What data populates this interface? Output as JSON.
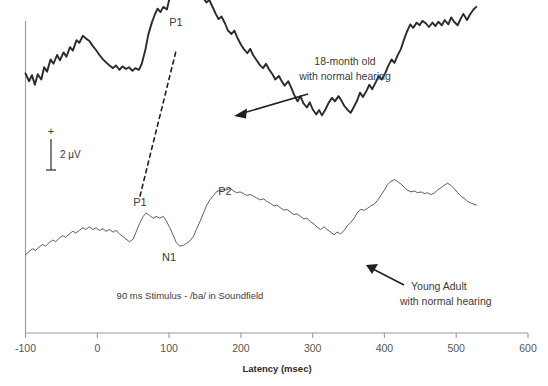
{
  "chart_data": {
    "type": "line",
    "title": "",
    "xlabel": "Latency (msec)",
    "ylabel": "",
    "xlim": [
      -100,
      600
    ],
    "ylim_note": "arbitrary microvolt scale, positive up",
    "xticks": [
      -100,
      0,
      100,
      200,
      300,
      400,
      500,
      600
    ],
    "xticklabels": [
      "-100",
      "0",
      "100",
      "200",
      "300",
      "400",
      "500",
      "600"
    ],
    "grid": false,
    "legend_position": "inline-annotations",
    "scale_bar": {
      "label": "2 µV",
      "positive_sign": "+",
      "negative_sign": "–",
      "microvolts": 2
    },
    "stimulus_note": "90 ms Stimulus - /ba/ in Soundfield",
    "series": [
      {
        "name": "18-month old with normal hearing",
        "style": "thick",
        "annotation": {
          "line1": "18-month old",
          "line2": "with normal hearing"
        },
        "peaks": [
          {
            "label": "P1",
            "latency_msec": 118,
            "note": "large positive peak"
          }
        ],
        "points": [
          [
            -100,
            2.55
          ],
          [
            -95,
            2.1
          ],
          [
            -91,
            2.45
          ],
          [
            -87,
            1.9
          ],
          [
            -83,
            2.5
          ],
          [
            -78,
            2.2
          ],
          [
            -74,
            2.9
          ],
          [
            -70,
            2.65
          ],
          [
            -65,
            3.35
          ],
          [
            -61,
            3.1
          ],
          [
            -56,
            3.6
          ],
          [
            -52,
            3.3
          ],
          [
            -47,
            3.75
          ],
          [
            -43,
            3.5
          ],
          [
            -38,
            4.05
          ],
          [
            -34,
            3.85
          ],
          [
            -29,
            4.45
          ],
          [
            -25,
            4.3
          ],
          [
            -20,
            4.7
          ],
          [
            -16,
            4.55
          ],
          [
            -11,
            4.4
          ],
          [
            -7,
            4.15
          ],
          [
            -2,
            3.9
          ],
          [
            3,
            3.6
          ],
          [
            8,
            3.35
          ],
          [
            13,
            3.15
          ],
          [
            17,
            3.0
          ],
          [
            22,
            2.85
          ],
          [
            26,
            3.0
          ],
          [
            31,
            2.75
          ],
          [
            35,
            2.95
          ],
          [
            40,
            2.8
          ],
          [
            44,
            2.9
          ],
          [
            49,
            2.7
          ],
          [
            53,
            2.85
          ],
          [
            58,
            2.75
          ],
          [
            62,
            3.1
          ],
          [
            67,
            3.9
          ],
          [
            71,
            4.75
          ],
          [
            76,
            5.45
          ],
          [
            80,
            5.9
          ],
          [
            84,
            6.25
          ],
          [
            88,
            6.05
          ],
          [
            92,
            6.35
          ],
          [
            97,
            6.2
          ],
          [
            101,
            6.9
          ],
          [
            105,
            7.55
          ],
          [
            110,
            8.15
          ],
          [
            114,
            8.6
          ],
          [
            118,
            8.85
          ],
          [
            122,
            8.45
          ],
          [
            126,
            8.6
          ],
          [
            130,
            8.15
          ],
          [
            134,
            7.7
          ],
          [
            139,
            7.95
          ],
          [
            143,
            7.45
          ],
          [
            147,
            6.9
          ],
          [
            152,
            6.6
          ],
          [
            156,
            6.75
          ],
          [
            160,
            6.4
          ],
          [
            165,
            5.95
          ],
          [
            169,
            5.65
          ],
          [
            173,
            5.8
          ],
          [
            178,
            5.4
          ],
          [
            182,
            5.0
          ],
          [
            187,
            4.8
          ],
          [
            191,
            5.0
          ],
          [
            195,
            4.6
          ],
          [
            200,
            4.2
          ],
          [
            204,
            3.95
          ],
          [
            209,
            3.7
          ],
          [
            213,
            3.95
          ],
          [
            217,
            3.6
          ],
          [
            222,
            3.3
          ],
          [
            226,
            3.05
          ],
          [
            231,
            2.85
          ],
          [
            235,
            3.1
          ],
          [
            239,
            2.8
          ],
          [
            244,
            2.5
          ],
          [
            248,
            2.2
          ],
          [
            253,
            2.4
          ],
          [
            257,
            2.1
          ],
          [
            261,
            1.85
          ],
          [
            266,
            2.1
          ],
          [
            270,
            1.75
          ],
          [
            274,
            1.35
          ],
          [
            279,
            0.95
          ],
          [
            283,
            1.25
          ],
          [
            287,
            0.85
          ],
          [
            292,
            0.6
          ],
          [
            296,
            0.9
          ],
          [
            300,
            0.5
          ],
          [
            305,
            0.2
          ],
          [
            309,
            0.45
          ],
          [
            313,
            0.15
          ],
          [
            318,
            0.5
          ],
          [
            322,
            0.85
          ],
          [
            327,
            1.15
          ],
          [
            331,
            0.95
          ],
          [
            336,
            1.25
          ],
          [
            340,
            1.0
          ],
          [
            344,
            0.7
          ],
          [
            349,
            0.45
          ],
          [
            353,
            0.3
          ],
          [
            357,
            0.6
          ],
          [
            362,
            1.0
          ],
          [
            366,
            1.45
          ],
          [
            370,
            1.2
          ],
          [
            375,
            1.55
          ],
          [
            379,
            1.9
          ],
          [
            383,
            1.65
          ],
          [
            388,
            2.05
          ],
          [
            392,
            2.4
          ],
          [
            396,
            2.2
          ],
          [
            401,
            2.55
          ],
          [
            405,
            2.95
          ],
          [
            410,
            3.35
          ],
          [
            414,
            3.15
          ],
          [
            418,
            3.55
          ],
          [
            423,
            3.95
          ],
          [
            427,
            4.45
          ],
          [
            431,
            4.9
          ],
          [
            436,
            5.35
          ],
          [
            440,
            5.15
          ],
          [
            445,
            5.45
          ],
          [
            449,
            5.3
          ],
          [
            453,
            5.55
          ],
          [
            458,
            5.4
          ],
          [
            462,
            5.2
          ],
          [
            467,
            5.45
          ],
          [
            471,
            5.25
          ],
          [
            475,
            5.5
          ],
          [
            480,
            5.3
          ],
          [
            484,
            5.6
          ],
          [
            489,
            5.35
          ],
          [
            493,
            5.75
          ],
          [
            497,
            5.5
          ],
          [
            502,
            5.3
          ],
          [
            506,
            5.65
          ],
          [
            510,
            5.95
          ],
          [
            515,
            5.6
          ],
          [
            519,
            5.9
          ],
          [
            524,
            6.2
          ],
          [
            528,
            6.35
          ]
        ]
      },
      {
        "name": "Young Adult with normal hearing",
        "style": "thin",
        "annotation": {
          "line1": "Young Adult",
          "line2": "with normal hearing"
        },
        "peaks": [
          {
            "label": "P1",
            "latency_msec": 60,
            "note": "small positive peak"
          },
          {
            "label": "N1",
            "latency_msec": 110,
            "note": "negative trough"
          },
          {
            "label": "P2",
            "latency_msec": 185,
            "note": "positive peak"
          }
        ],
        "points": [
          [
            -100,
            -1.25
          ],
          [
            -95,
            -1.05
          ],
          [
            -90,
            -0.9
          ],
          [
            -86,
            -1.0
          ],
          [
            -81,
            -0.8
          ],
          [
            -76,
            -0.65
          ],
          [
            -72,
            -0.75
          ],
          [
            -67,
            -0.55
          ],
          [
            -62,
            -0.4
          ],
          [
            -58,
            -0.5
          ],
          [
            -53,
            -0.3
          ],
          [
            -48,
            -0.15
          ],
          [
            -44,
            -0.25
          ],
          [
            -39,
            -0.05
          ],
          [
            -34,
            0.1
          ],
          [
            -30,
            0.0
          ],
          [
            -25,
            0.15
          ],
          [
            -20,
            0.3
          ],
          [
            -16,
            0.2
          ],
          [
            -11,
            0.35
          ],
          [
            -6,
            0.2
          ],
          [
            -2,
            0.3
          ],
          [
            3,
            0.15
          ],
          [
            8,
            0.25
          ],
          [
            12,
            0.1
          ],
          [
            17,
            0.2
          ],
          [
            22,
            0.05
          ],
          [
            26,
            0.15
          ],
          [
            31,
            -0.05
          ],
          [
            36,
            -0.2
          ],
          [
            40,
            -0.35
          ],
          [
            45,
            -0.5
          ],
          [
            50,
            -0.35
          ],
          [
            54,
            0.05
          ],
          [
            59,
            0.55
          ],
          [
            64,
            0.95
          ],
          [
            68,
            1.15
          ],
          [
            73,
            1.0
          ],
          [
            78,
            0.85
          ],
          [
            82,
            0.95
          ],
          [
            87,
            0.85
          ],
          [
            92,
            0.95
          ],
          [
            96,
            0.7
          ],
          [
            101,
            0.3
          ],
          [
            106,
            -0.15
          ],
          [
            110,
            -0.55
          ],
          [
            115,
            -0.75
          ],
          [
            120,
            -0.7
          ],
          [
            124,
            -0.6
          ],
          [
            129,
            -0.45
          ],
          [
            134,
            -0.2
          ],
          [
            138,
            0.2
          ],
          [
            143,
            0.65
          ],
          [
            148,
            1.15
          ],
          [
            152,
            1.55
          ],
          [
            157,
            1.9
          ],
          [
            162,
            2.15
          ],
          [
            166,
            2.35
          ],
          [
            171,
            2.45
          ],
          [
            176,
            2.5
          ],
          [
            180,
            2.45
          ],
          [
            185,
            2.55
          ],
          [
            190,
            2.4
          ],
          [
            194,
            2.3
          ],
          [
            199,
            2.35
          ],
          [
            204,
            2.25
          ],
          [
            208,
            2.15
          ],
          [
            213,
            2.2
          ],
          [
            218,
            2.1
          ],
          [
            222,
            2.0
          ],
          [
            227,
            1.9
          ],
          [
            232,
            1.95
          ],
          [
            236,
            1.8
          ],
          [
            241,
            1.7
          ],
          [
            246,
            1.55
          ],
          [
            250,
            1.6
          ],
          [
            255,
            1.45
          ],
          [
            260,
            1.3
          ],
          [
            264,
            1.35
          ],
          [
            269,
            1.2
          ],
          [
            274,
            1.05
          ],
          [
            278,
            1.1
          ],
          [
            283,
            0.95
          ],
          [
            288,
            0.8
          ],
          [
            292,
            0.85
          ],
          [
            297,
            0.65
          ],
          [
            302,
            0.5
          ],
          [
            306,
            0.35
          ],
          [
            311,
            0.2
          ],
          [
            316,
            0.35
          ],
          [
            320,
            0.2
          ],
          [
            325,
            0.05
          ],
          [
            330,
            -0.1
          ],
          [
            334,
            0.05
          ],
          [
            339,
            -0.05
          ],
          [
            344,
            0.15
          ],
          [
            348,
            0.4
          ],
          [
            353,
            0.6
          ],
          [
            358,
            0.85
          ],
          [
            362,
            1.15
          ],
          [
            367,
            1.35
          ],
          [
            372,
            1.3
          ],
          [
            376,
            1.4
          ],
          [
            381,
            1.55
          ],
          [
            386,
            1.65
          ],
          [
            390,
            1.85
          ],
          [
            395,
            2.15
          ],
          [
            400,
            2.45
          ],
          [
            404,
            2.75
          ],
          [
            409,
            2.95
          ],
          [
            414,
            3.05
          ],
          [
            418,
            2.95
          ],
          [
            423,
            2.8
          ],
          [
            428,
            2.6
          ],
          [
            432,
            2.45
          ],
          [
            437,
            2.35
          ],
          [
            442,
            2.4
          ],
          [
            446,
            2.3
          ],
          [
            451,
            2.35
          ],
          [
            456,
            2.25
          ],
          [
            460,
            2.3
          ],
          [
            465,
            2.2
          ],
          [
            470,
            2.3
          ],
          [
            474,
            2.45
          ],
          [
            479,
            2.6
          ],
          [
            484,
            2.75
          ],
          [
            488,
            2.85
          ],
          [
            493,
            2.7
          ],
          [
            498,
            2.5
          ],
          [
            502,
            2.3
          ],
          [
            507,
            2.1
          ],
          [
            512,
            1.95
          ],
          [
            516,
            1.8
          ],
          [
            521,
            1.7
          ],
          [
            528,
            1.6
          ]
        ]
      }
    ],
    "dashed_connector": {
      "label": "P1 latency shift",
      "from": {
        "latency_msec": 60,
        "series": "Young Adult with normal hearing"
      },
      "to": {
        "latency_msec": 118,
        "series": "18-month old with normal hearing"
      }
    }
  },
  "labels": {
    "peak_p1_infant": "P1",
    "peak_p1_adult": "P1",
    "peak_n1_adult": "N1",
    "peak_p2_adult": "P2",
    "annot_infant_line1": "18-month old",
    "annot_infant_line2": "with normal hearing",
    "annot_adult_line1": "Young Adult",
    "annot_adult_line2": "with normal hearing",
    "stimulus": "90 ms Stimulus - /ba/ in Soundfield",
    "scale_plus": "+",
    "scale_minus": "–",
    "scale_value": "2 µV",
    "axis_title": "Latency (msec)",
    "xtick_0": "-100",
    "xtick_1": "0",
    "xtick_2": "100",
    "xtick_3": "200",
    "xtick_4": "300",
    "xtick_5": "400",
    "xtick_6": "500",
    "xtick_7": "600"
  },
  "colors": {
    "background": "#ffffff",
    "trace_thick": "#2b2b2b",
    "trace_thin": "#555555",
    "axis": "#9a9a9a",
    "text": "#3a3a3a"
  }
}
